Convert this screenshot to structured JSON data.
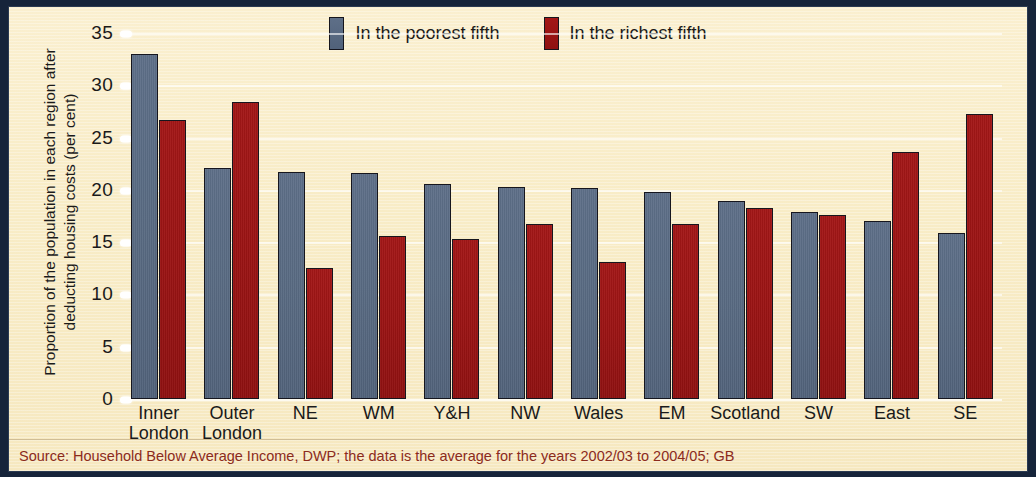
{
  "chart_data": {
    "type": "bar",
    "title": "",
    "xlabel": "",
    "ylabel": "Proportion of the population in each region after deducting housing costs (per cent)",
    "ylim": [
      0,
      35
    ],
    "ytick_labels": [
      "35",
      "30",
      "25",
      "20",
      "15",
      "10",
      "5",
      "0"
    ],
    "ytick_values": [
      35,
      30,
      25,
      20,
      15,
      10,
      5,
      0
    ],
    "grid": true,
    "legend_position": "top-center",
    "categories": [
      "Inner\nLondon",
      "Outer\nLondon",
      "NE",
      "WM",
      "Y&H",
      "NW",
      "Wales",
      "EM",
      "Scotland",
      "SW",
      "East",
      "SE"
    ],
    "series": [
      {
        "name": "In the poorest fifth",
        "color": "#586a82",
        "values": [
          33.0,
          22.1,
          21.7,
          21.6,
          20.6,
          20.3,
          20.2,
          19.8,
          18.9,
          17.9,
          17.0,
          15.9
        ]
      },
      {
        "name": "In the richest fifth",
        "color": "#9b1414",
        "values": [
          26.7,
          28.4,
          12.5,
          15.6,
          15.3,
          16.7,
          13.1,
          16.7,
          18.3,
          17.6,
          23.6,
          27.3
        ]
      }
    ]
  },
  "legend": {
    "items": [
      {
        "label": "In the poorest fifth"
      },
      {
        "label": "In the richest fifth"
      }
    ]
  },
  "footer": {
    "source": "Source: Household Below Average Income, DWP; the data is the average for the years 2002/03 to 2004/05; GB"
  },
  "colors": {
    "frame": "#16243a",
    "panel": "#f8ecc6",
    "poorest": "#586a82",
    "richest": "#9b1414",
    "source_text": "#8c2b1c",
    "gridline": "#ffffff"
  }
}
